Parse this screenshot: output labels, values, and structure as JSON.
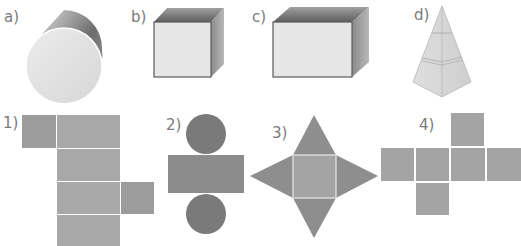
{
  "solids": {
    "a": {
      "label": "a)",
      "shape": "cylinder"
    },
    "b": {
      "label": "b)",
      "shape": "cube"
    },
    "c": {
      "label": "c)",
      "shape": "cuboid"
    },
    "d": {
      "label": "d)",
      "shape": "pyramid"
    }
  },
  "nets": {
    "n1": {
      "label": "1)",
      "shape": "cuboid-net"
    },
    "n2": {
      "label": "2)",
      "shape": "cylinder-net"
    },
    "n3": {
      "label": "3)",
      "shape": "pyramid-net"
    },
    "n4": {
      "label": "4)",
      "shape": "cube-net"
    }
  },
  "colors": {
    "net_fill": "#a8a8a8",
    "net_dark": "#8a8a8a",
    "circle_fill": "#7a7a7a",
    "face_light": "#e6e6e6",
    "label": "#7a7a7a"
  }
}
